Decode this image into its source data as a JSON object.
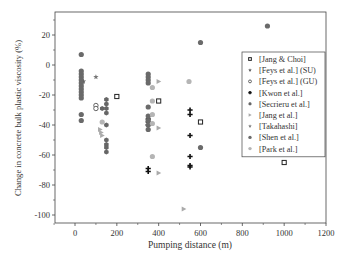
{
  "chart_data": {
    "type": "scatter",
    "title": "",
    "xlabel": "Pumping distance (m)",
    "ylabel": "Change in concrete bulk plastic viscosity (%)",
    "xlim": [
      -100,
      1200
    ],
    "ylim": [
      -105,
      35
    ],
    "xticks": [
      0,
      200,
      400,
      600,
      800,
      1000,
      1200
    ],
    "yticks": [
      20,
      0,
      -20,
      -40,
      -60,
      -80,
      -100
    ],
    "xtick_labels": [
      "0",
      "200",
      "400",
      "600",
      "800",
      "1000",
      "1200"
    ],
    "ytick_labels": [
      "20",
      "0",
      "-20",
      "-40",
      "-60",
      "-80",
      "-100"
    ],
    "grid": false,
    "legend_position": "right",
    "series": [
      {
        "name": "[Jang & Choi]",
        "marker": "square-open",
        "color": "#222222",
        "points": [
          [
            200,
            -21
          ],
          [
            400,
            -24
          ],
          [
            600,
            -38
          ],
          [
            1000,
            -65
          ]
        ]
      },
      {
        "name": "[Feys et al.] (SU)",
        "marker": "star",
        "color": "#555555",
        "points": [
          [
            40,
            -11
          ]
        ]
      },
      {
        "name": "[Feys et al.] (GU)",
        "marker": "circle-open",
        "color": "#555555",
        "points": [
          [
            100,
            -27
          ],
          [
            100,
            -29
          ]
        ]
      },
      {
        "name": "[Kwon et al.]",
        "marker": "plus",
        "color": "#111111",
        "points": [
          [
            350,
            -36
          ],
          [
            350,
            -38
          ],
          [
            350,
            -40
          ],
          [
            350,
            -69
          ],
          [
            350,
            -71
          ],
          [
            550,
            -30
          ],
          [
            550,
            -33
          ],
          [
            550,
            -47
          ],
          [
            550,
            -61
          ],
          [
            550,
            -67
          ],
          [
            550,
            -68
          ]
        ]
      },
      {
        "name": "[Secrieru et al.]",
        "marker": "hexagon",
        "color": "#666666",
        "points": [
          [
            150,
            -23
          ],
          [
            150,
            -26
          ],
          [
            150,
            -29
          ],
          [
            150,
            -32
          ],
          [
            150,
            -40
          ],
          [
            150,
            -50
          ],
          [
            150,
            -53
          ],
          [
            150,
            -55
          ],
          [
            150,
            -58
          ],
          [
            130,
            -29
          ]
        ]
      },
      {
        "name": "[Jang et al.]",
        "marker": "triangle-right",
        "color": "#aaaaaa",
        "points": [
          [
            120,
            -43
          ],
          [
            125,
            -45
          ],
          [
            130,
            -47
          ],
          [
            400,
            -11
          ],
          [
            400,
            -42
          ],
          [
            400,
            -72
          ],
          [
            520,
            -96
          ]
        ]
      },
      {
        "name": "[Takahashi]",
        "marker": "star",
        "color": "#777777",
        "points": [
          [
            100,
            -8
          ]
        ]
      },
      {
        "name": "[Shen et al.]",
        "marker": "circle",
        "color": "#6a6a6a",
        "points": [
          [
            30,
            7
          ],
          [
            30,
            -4
          ],
          [
            30,
            -6
          ],
          [
            30,
            -8
          ],
          [
            30,
            -10
          ],
          [
            30,
            -12
          ],
          [
            30,
            -14
          ],
          [
            30,
            -16
          ],
          [
            30,
            -18
          ],
          [
            30,
            -20
          ],
          [
            30,
            -22
          ],
          [
            30,
            -33
          ],
          [
            30,
            -37
          ],
          [
            350,
            -6
          ],
          [
            350,
            -8
          ],
          [
            350,
            -10
          ],
          [
            350,
            -12
          ],
          [
            350,
            -28
          ],
          [
            350,
            -34
          ],
          [
            350,
            -37
          ],
          [
            350,
            -40
          ],
          [
            350,
            -43
          ],
          [
            600,
            15
          ],
          [
            600,
            -55
          ],
          [
            920,
            26
          ]
        ]
      },
      {
        "name": "[Park et al.]",
        "marker": "circle",
        "color": "#b5b5b5",
        "points": [
          [
            130,
            -38
          ],
          [
            370,
            -15
          ],
          [
            370,
            -24
          ],
          [
            370,
            -33
          ],
          [
            370,
            -39
          ],
          [
            370,
            -61
          ],
          [
            545,
            -11
          ]
        ]
      }
    ]
  }
}
